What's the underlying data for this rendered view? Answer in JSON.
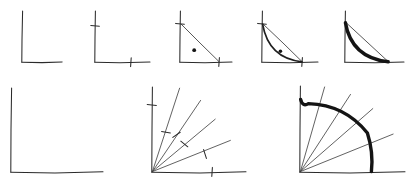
{
  "figure": {
    "background_color": "#ffffff",
    "ink_color": "#2b2b2b",
    "bold_ink_color": "#141414",
    "width": 412,
    "height": 195,
    "row_count": 2
  },
  "rows": [
    {
      "name": "top-row",
      "description": "Five-step construction of a concave curve inside a right angle",
      "panel_count": 5
    },
    {
      "name": "bottom-row",
      "description": "Three-step construction of a quarter circle from radial rays",
      "panel_count": 3
    }
  ],
  "panels": [
    {
      "id": "panel-1",
      "row": "top-row",
      "step": 1,
      "label": "bare-axes",
      "origin": [
        22,
        62
      ],
      "x_axis_end": [
        62,
        62
      ],
      "y_axis_top": [
        22,
        11
      ],
      "ticks": [],
      "chord": null,
      "dot": null,
      "arc": null
    },
    {
      "id": "panel-2",
      "row": "top-row",
      "step": 2,
      "label": "axes-with-ticks",
      "origin": [
        95,
        62
      ],
      "x_axis_end": [
        150,
        62
      ],
      "y_axis_top": [
        95,
        11
      ],
      "ticks": [
        {
          "axis": "y",
          "at": [
            95,
            26
          ],
          "length": 8
        },
        {
          "axis": "x",
          "at": [
            131,
            62
          ],
          "length": 8
        }
      ],
      "chord": null,
      "dot": null,
      "arc": null
    },
    {
      "id": "panel-3",
      "row": "top-row",
      "step": 3,
      "label": "chord-and-interior-point",
      "origin": [
        180,
        62
      ],
      "x_axis_end": [
        232,
        62
      ],
      "y_axis_top": [
        180,
        11
      ],
      "ticks": [
        {
          "axis": "y",
          "at": [
            180,
            24
          ],
          "length": 8
        },
        {
          "axis": "x",
          "at": [
            219,
            62
          ],
          "length": 8
        }
      ],
      "chord": {
        "from": [
          180,
          24
        ],
        "to": [
          219,
          62
        ]
      },
      "dot": {
        "at": [
          194,
          50
        ],
        "radius": 1.9
      },
      "arc": null
    },
    {
      "id": "panel-4",
      "row": "top-row",
      "step": 4,
      "label": "curve-through-point",
      "origin": [
        262,
        62
      ],
      "x_axis_end": [
        318,
        62
      ],
      "y_axis_top": [
        262,
        11
      ],
      "ticks": [
        {
          "axis": "y",
          "at": [
            262,
            24
          ],
          "length": 8
        },
        {
          "axis": "x",
          "at": [
            302,
            62
          ],
          "length": 8
        }
      ],
      "chord": {
        "from": [
          262,
          24
        ],
        "to": [
          302,
          62
        ]
      },
      "dot": {
        "at": [
          280,
          51
        ],
        "radius": 1.8
      },
      "arc": {
        "from": [
          262,
          24
        ],
        "control": [
          268,
          58
        ],
        "to": [
          302,
          62
        ],
        "weight": "thin"
      }
    },
    {
      "id": "panel-5",
      "row": "top-row",
      "step": 5,
      "label": "bold-curve",
      "origin": [
        345,
        62
      ],
      "x_axis_end": [
        404,
        62
      ],
      "y_axis_top": [
        345,
        11
      ],
      "ticks": [],
      "chord": {
        "from": [
          345,
          22
        ],
        "to": [
          388,
          62
        ]
      },
      "dot": null,
      "arc": {
        "from": [
          345,
          22
        ],
        "control": [
          351,
          57
        ],
        "to": [
          388,
          62
        ],
        "weight": "bold"
      }
    },
    {
      "id": "panel-6",
      "row": "bottom-row",
      "step": 1,
      "label": "bare-axes-large",
      "origin": [
        11,
        172
      ],
      "x_axis_end": [
        103,
        172
      ],
      "y_axis_top": [
        11,
        88
      ],
      "rays": [],
      "ticks": [],
      "arc": null
    },
    {
      "id": "panel-7",
      "row": "bottom-row",
      "step": 2,
      "label": "radial-rays-with-ticks",
      "origin": [
        152,
        172
      ],
      "x_axis_end": [
        246,
        172
      ],
      "y_axis_top": [
        152,
        87
      ],
      "ray_count": 5,
      "rays": [
        {
          "angle_deg": 72,
          "length": 88,
          "tick_at": 0.45
        },
        {
          "angle_deg": 56,
          "length": 86,
          "tick_at": 0.52
        },
        {
          "angle_deg": 40,
          "length": 82,
          "tick_at": 0.5
        },
        {
          "angle_deg": 22,
          "length": 84,
          "tick_at": 0.62
        },
        {
          "angle_deg": 0,
          "length": 94,
          "tick_at": 0.58
        }
      ],
      "ticks": [
        {
          "axis": "y",
          "at": [
            152,
            105
          ],
          "length": 8
        }
      ],
      "arc": null
    },
    {
      "id": "panel-8",
      "row": "bottom-row",
      "step": 3,
      "label": "quarter-circle-bold",
      "origin": [
        300,
        172
      ],
      "x_axis_end": [
        405,
        172
      ],
      "y_axis_top": [
        300,
        86
      ],
      "radius": 73,
      "ray_count": 5,
      "rays": [
        {
          "angle_deg": 74,
          "length": 88
        },
        {
          "angle_deg": 57,
          "length": 92
        },
        {
          "angle_deg": 41,
          "length": 96
        },
        {
          "angle_deg": 22,
          "length": 100
        },
        {
          "angle_deg": 0,
          "length": 105
        }
      ],
      "ticks": [],
      "arc": {
        "weight": "bold",
        "start_angle_deg": 90,
        "end_angle_deg": 0
      }
    }
  ]
}
